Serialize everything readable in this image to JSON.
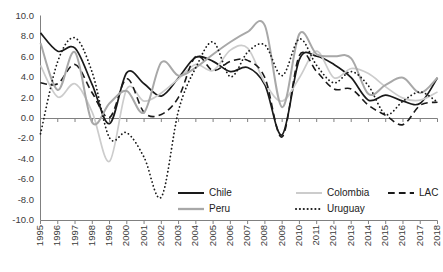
{
  "chart_data": {
    "type": "line",
    "title": "",
    "xlabel": "",
    "ylabel": "",
    "xlim": [
      1995,
      2018
    ],
    "ylim": [
      -10.0,
      10.0
    ],
    "grid": false,
    "legend_position": "bottom",
    "x": [
      1995,
      1996,
      1997,
      1998,
      1999,
      2000,
      2001,
      2002,
      2003,
      2004,
      2005,
      2006,
      2007,
      2008,
      2009,
      2010,
      2011,
      2012,
      2013,
      2014,
      2015,
      2016,
      2017,
      2018
    ],
    "y_ticks": [
      "-10.0",
      "-8.0",
      "-6.0",
      "-4.0",
      "-2.0",
      "0.0",
      "2.0",
      "4.0",
      "6.0",
      "8.0",
      "10.0"
    ],
    "x_ticks": [
      "1995",
      "1996",
      "1997",
      "1998",
      "1999",
      "2000",
      "2001",
      "2002",
      "2003",
      "2004",
      "2005",
      "2006",
      "2007",
      "2008",
      "2009",
      "2010",
      "2011",
      "2012",
      "2013",
      "2014",
      "2015",
      "2016",
      "2017",
      "2018"
    ],
    "series": [
      {
        "name": "Chile",
        "color": "#1a1a1a",
        "style": "solid",
        "width": 1.7,
        "values": [
          8.4,
          6.6,
          6.9,
          3.3,
          -0.5,
          4.5,
          3.4,
          2.2,
          4.0,
          6.0,
          5.6,
          4.6,
          5.0,
          3.3,
          -1.6,
          5.8,
          6.1,
          5.3,
          4.0,
          1.8,
          2.3,
          1.7,
          1.5,
          4.0
        ]
      },
      {
        "name": "Colombia",
        "color": "#cccccc",
        "style": "solid",
        "width": 1.7,
        "values": [
          5.2,
          2.1,
          3.4,
          0.6,
          -4.2,
          2.9,
          1.7,
          2.5,
          3.9,
          5.3,
          4.7,
          6.7,
          6.9,
          3.5,
          1.7,
          4.0,
          6.6,
          4.0,
          4.9,
          4.4,
          3.1,
          2.0,
          1.8,
          2.6
        ]
      },
      {
        "name": "LAC",
        "color": "#1a1a1a",
        "style": "dashed",
        "width": 1.6,
        "values": [
          3.5,
          3.4,
          5.3,
          2.5,
          0.1,
          3.9,
          0.6,
          0.4,
          2.1,
          6.1,
          4.7,
          5.6,
          5.7,
          4.0,
          -1.8,
          6.2,
          4.6,
          2.9,
          2.9,
          1.3,
          0.3,
          -0.6,
          1.3,
          1.6
        ]
      },
      {
        "name": "Peru",
        "color": "#a8a8a8",
        "style": "solid",
        "width": 2.0,
        "values": [
          7.4,
          2.8,
          6.5,
          -0.4,
          1.5,
          2.7,
          0.6,
          5.5,
          4.2,
          5.0,
          6.3,
          7.5,
          8.5,
          9.1,
          1.1,
          8.3,
          6.3,
          6.1,
          5.9,
          2.4,
          3.3,
          4.0,
          2.5,
          4.0
        ]
      },
      {
        "name": "Uruguay",
        "color": "#1a1a1a",
        "style": "dotted",
        "width": 1.8,
        "values": [
          -1.5,
          5.6,
          7.9,
          4.5,
          -1.9,
          -1.4,
          -3.8,
          -7.7,
          0.8,
          5.0,
          7.5,
          4.1,
          6.5,
          7.2,
          4.2,
          7.8,
          5.2,
          3.5,
          4.6,
          3.2,
          0.4,
          1.7,
          2.6,
          1.6
        ]
      }
    ]
  },
  "legend": {
    "row1": [
      {
        "label": "Chile",
        "series": 0
      },
      {
        "label": "Colombia",
        "series": 1
      },
      {
        "label": "LAC",
        "series": 2
      }
    ],
    "row2": [
      {
        "label": "Peru",
        "series": 3
      },
      {
        "label": "Uruguay",
        "series": 4
      }
    ]
  },
  "axis": {
    "zero_line_label": "0.0",
    "axis_color": "#808080"
  }
}
